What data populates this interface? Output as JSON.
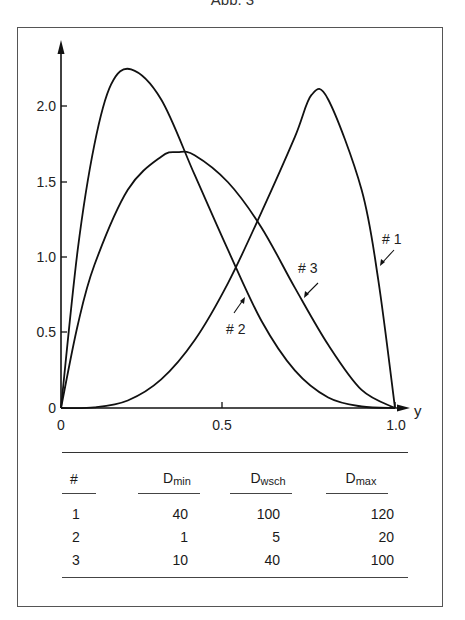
{
  "figure": {
    "title": "Abb. 3"
  },
  "chart_data": {
    "type": "line",
    "title": "Abb. 3",
    "xlabel": "y",
    "ylabel": "",
    "xlim": [
      0,
      1.0
    ],
    "ylim": [
      0,
      2.4
    ],
    "x_ticks": [
      "0",
      "0.5",
      "1.0"
    ],
    "y_ticks": [
      "0",
      "0.5",
      "1.0",
      "1.5",
      "2.0"
    ],
    "grid": false,
    "legend": "inline curve labels with arrows",
    "series": [
      {
        "name": "# 1",
        "distribution": "PERT-like beta",
        "mode_x": 0.75,
        "peak_y": 2.08,
        "points": [
          [
            0,
            0
          ],
          [
            0.1,
            0.004
          ],
          [
            0.2,
            0.05
          ],
          [
            0.3,
            0.19
          ],
          [
            0.4,
            0.45
          ],
          [
            0.5,
            0.83
          ],
          [
            0.6,
            1.3
          ],
          [
            0.7,
            1.8
          ],
          [
            0.75,
            2.08
          ],
          [
            0.8,
            2.05
          ],
          [
            0.9,
            1.45
          ],
          [
            0.95,
            0.85
          ],
          [
            1.0,
            0
          ]
        ]
      },
      {
        "name": "# 2",
        "distribution": "PERT-like beta",
        "mode_x": 0.21,
        "peak_y": 2.25,
        "points": [
          [
            0,
            0
          ],
          [
            0.05,
            1.05
          ],
          [
            0.1,
            1.75
          ],
          [
            0.15,
            2.15
          ],
          [
            0.21,
            2.25
          ],
          [
            0.3,
            2.05
          ],
          [
            0.4,
            1.55
          ],
          [
            0.5,
            1.05
          ],
          [
            0.6,
            0.58
          ],
          [
            0.7,
            0.25
          ],
          [
            0.8,
            0.07
          ],
          [
            0.9,
            0.01
          ],
          [
            1.0,
            0
          ]
        ]
      },
      {
        "name": "# 3",
        "distribution": "PERT-like beta",
        "mode_x": 0.35,
        "peak_y": 1.7,
        "points": [
          [
            0,
            0
          ],
          [
            0.05,
            0.55
          ],
          [
            0.1,
            0.95
          ],
          [
            0.2,
            1.45
          ],
          [
            0.3,
            1.67
          ],
          [
            0.35,
            1.7
          ],
          [
            0.4,
            1.68
          ],
          [
            0.5,
            1.5
          ],
          [
            0.6,
            1.2
          ],
          [
            0.7,
            0.8
          ],
          [
            0.8,
            0.42
          ],
          [
            0.9,
            0.12
          ],
          [
            1.0,
            0
          ]
        ]
      }
    ]
  },
  "table": {
    "headers": {
      "num": "#",
      "dmin": "D",
      "dmin_sub": "min",
      "dwsch": "D",
      "dwsch_sub": "wsch",
      "dmax": "D",
      "dmax_sub": "max"
    },
    "rows": [
      {
        "num": "1",
        "dmin": "40",
        "dwsch": "100",
        "dmax": "120"
      },
      {
        "num": "2",
        "dmin": "1",
        "dwsch": "5",
        "dmax": "20"
      },
      {
        "num": "3",
        "dmin": "10",
        "dwsch": "40",
        "dmax": "100"
      }
    ]
  }
}
